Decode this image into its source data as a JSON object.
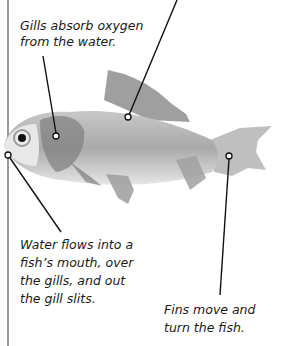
{
  "diagram": {
    "subject": "fish",
    "labels": {
      "gills": "Gills absorb oxygen from the water.",
      "water": "Water flows into a fish's mouth, over the gills, and out the gill slits.",
      "fins": "Fins move and turn the fish."
    },
    "gills_lines": [
      "Gills absorb oxygen",
      "from the water."
    ],
    "water_lines": [
      "Water flows into a",
      "fish’s mouth, over",
      "the gills, and out",
      "the gill slits."
    ],
    "fins_lines": [
      "Fins move and",
      "turn the fish."
    ]
  }
}
